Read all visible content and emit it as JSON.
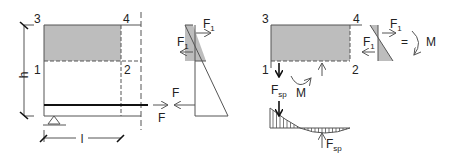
{
  "colors": {
    "line": "#555555",
    "shade": "#bdbdbd",
    "text": "#222222",
    "bold": "#111111"
  },
  "left_panel": {
    "corner_labels": [
      "3",
      "4",
      "1",
      "2"
    ],
    "height_label": "h",
    "length_label": "l",
    "force_label_top": "F",
    "force_label_bottom": "F"
  },
  "stress_triangle": {
    "force_top": "F",
    "force_top_sub": "1",
    "force_mid": "F",
    "force_mid_sub": "1"
  },
  "right_panel": {
    "corner_labels": [
      "3",
      "4",
      "1",
      "2"
    ],
    "moment_label": "M",
    "spalling_force": "F",
    "spalling_force_sub": "sp",
    "equivalence_sign": "=",
    "equiv_moment_label": "M",
    "small_f_top": "F",
    "small_f_top_sub": "1",
    "small_f_mid": "F",
    "small_f_mid_sub": "1",
    "bottom_force": "F",
    "bottom_force_sub": "sp"
  }
}
